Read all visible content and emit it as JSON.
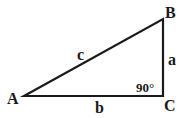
{
  "diagram": {
    "type": "right-triangle",
    "vertices": {
      "A": {
        "label": "A"
      },
      "B": {
        "label": "B"
      },
      "C": {
        "label": "C"
      }
    },
    "sides": {
      "hypotenuse": {
        "label": "c"
      },
      "vertical": {
        "label": "a"
      },
      "base": {
        "label": "b"
      }
    },
    "angle_label": "90°",
    "colors": {
      "stroke": "#1a1a1a",
      "background": "#ffffff"
    }
  }
}
